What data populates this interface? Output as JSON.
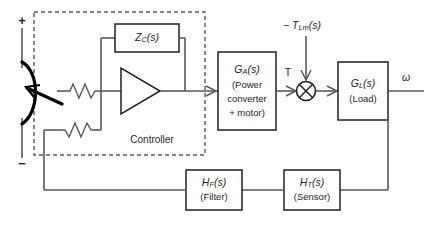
{
  "diagram": {
    "type": "control-block-diagram",
    "source": {
      "name": "voltage-source",
      "plus_label": "+",
      "minus_label": "−"
    },
    "controller": {
      "label": "Controller",
      "feedback_block": {
        "name": "Zc",
        "main": "Z",
        "sub": "C",
        "tail": "(s)"
      },
      "amplifier": {
        "name": "op-amp",
        "label": ""
      },
      "input_resistor": {
        "name": "input-resistor",
        "label": ""
      },
      "feedback_resistor": {
        "name": "feedback-resistor",
        "label": ""
      }
    },
    "blocks": [
      {
        "id": "ga",
        "main": "G",
        "sub": "A",
        "tail": "(s)",
        "lines": [
          "(Power",
          "converter",
          "+ motor)"
        ]
      },
      {
        "id": "gl",
        "main": "G",
        "sub": "L",
        "tail": "(s)",
        "lines": [
          "(Load)"
        ]
      },
      {
        "id": "hf",
        "main": "H",
        "sub": "F",
        "tail": "(s)",
        "lines": [
          "(Filter)"
        ]
      },
      {
        "id": "ht",
        "main": "H",
        "sub": "T",
        "tail": "(s)",
        "lines": [
          "(Sensor)"
        ]
      }
    ],
    "summing_junction": {
      "name": "summing-junction",
      "style": "cross-circle"
    },
    "signals": {
      "torque": "T",
      "disturbance_prefix": "− ",
      "disturbance_main": "T",
      "disturbance_sub": "Lm",
      "disturbance_tail": "(s)",
      "output": "ω"
    },
    "colors": {
      "wire": "#58595b",
      "outline": "#231f20",
      "background": "#ffffff"
    }
  }
}
